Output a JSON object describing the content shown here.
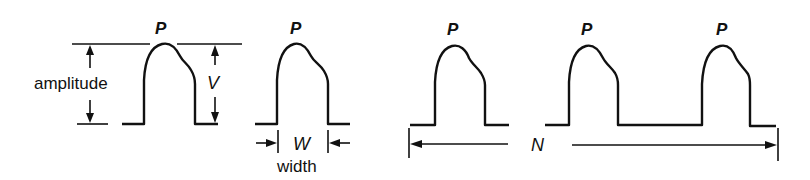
{
  "diagram": {
    "title": "",
    "labels": {
      "peak": "P",
      "amplitude": "amplitude",
      "amplitude_symbol": "V",
      "width_symbol": "W",
      "width": "width",
      "count_symbol": "N"
    },
    "panels": [
      {
        "id": "amplitude-panel",
        "description": "Single pulse with amplitude dimension",
        "peak_label": "P",
        "dimension_label": "amplitude",
        "symbol": "V"
      },
      {
        "id": "width-panel",
        "description": "Single pulse with width dimension",
        "peak_label": "P",
        "symbol": "W",
        "dimension_label": "width"
      },
      {
        "id": "count-panel",
        "description": "Train of three pulses spanning count N",
        "peak_labels": [
          "P",
          "P",
          "P"
        ],
        "symbol": "N"
      }
    ],
    "colors": {
      "stroke": "#111111",
      "background": "#ffffff"
    }
  }
}
